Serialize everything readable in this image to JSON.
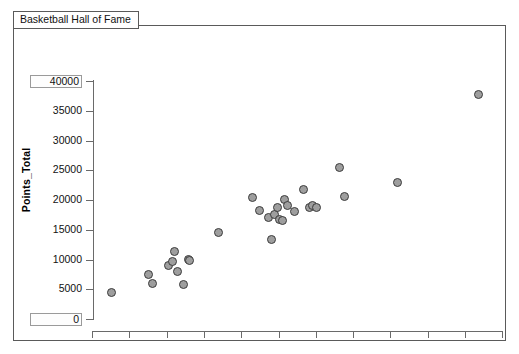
{
  "window": {
    "tab_label": "Basketball Hall of Fame"
  },
  "axes": {
    "x_title": "Minutes_Total (minutes)",
    "y_title": "Points_Total",
    "x_ticks": [
      "5000",
      "10000",
      "15000",
      "20000",
      "25000",
      "30000",
      "35000",
      "40000",
      "45000",
      "50000",
      "55000",
      "60000"
    ],
    "y_ticks": [
      "40000",
      "35000",
      "30000",
      "25000",
      "20000",
      "15000",
      "10000",
      "5000",
      "0"
    ],
    "x_boxed_ticks": [
      "5000",
      "60000"
    ],
    "y_boxed_ticks": [
      "40000",
      "0"
    ]
  },
  "colors": {
    "marker_fill": "#9e9e9e",
    "marker_stroke": "#3c3c3c",
    "axis": "#6a6a6a",
    "frame": "#5a5a5a",
    "background": "#ffffff"
  },
  "chart_data": {
    "type": "scatter",
    "title": "Basketball Hall of Fame",
    "xlabel": "Minutes_Total (minutes)",
    "ylabel": "Points_Total",
    "xlim": [
      5000,
      60000
    ],
    "ylim": [
      0,
      40000
    ],
    "grid": false,
    "legend": null,
    "x": [
      7600,
      12600,
      13100,
      15300,
      15800,
      16100,
      16500,
      17300,
      17900,
      18100,
      21900,
      26500,
      27400,
      28600,
      29100,
      29500,
      29800,
      30100,
      30500,
      30800,
      31200,
      32100,
      33300,
      34100,
      34600,
      35100,
      38200,
      38900,
      45900,
      56800
    ],
    "y": [
      4400,
      7500,
      6000,
      9000,
      9600,
      11400,
      8000,
      5800,
      10000,
      9900,
      14600,
      20400,
      18200,
      17000,
      13300,
      17500,
      18700,
      16700,
      16500,
      20100,
      19100,
      18000,
      21700,
      18800,
      19000,
      18800,
      25400,
      20600,
      22900,
      37800
    ],
    "n_points": 30
  }
}
